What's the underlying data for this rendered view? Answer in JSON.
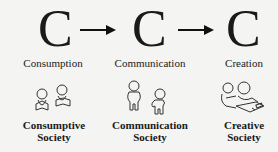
{
  "stages": [
    {
      "letter": "C",
      "label": "Consumption",
      "society": [
        "Consumptive",
        "Society"
      ],
      "icon": "people-reading-icon"
    },
    {
      "letter": "C",
      "label": "Communication",
      "society": [
        "Communication",
        "Society"
      ],
      "icon": "people-talking-icon"
    },
    {
      "letter": "C",
      "label": "Creation",
      "society": [
        "Creative",
        "Society"
      ],
      "icon": "people-making-icon"
    }
  ],
  "arrows": [
    "right-arrow-icon",
    "right-arrow-icon"
  ]
}
